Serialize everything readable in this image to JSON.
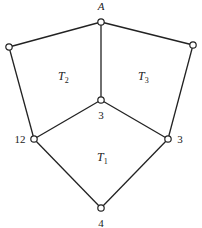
{
  "diagram": {
    "nodes": [
      {
        "id": "A",
        "x": 101,
        "y": 22,
        "label": "A",
        "label_x": 101,
        "label_y": 10,
        "italic": true
      },
      {
        "id": "LT",
        "x": 9,
        "y": 47,
        "label": "",
        "label_x": 0,
        "label_y": 0
      },
      {
        "id": "RT",
        "x": 193,
        "y": 45,
        "label": "",
        "label_x": 0,
        "label_y": 0
      },
      {
        "id": "C",
        "x": 101,
        "y": 100,
        "label": "3",
        "label_x": 101,
        "label_y": 119
      },
      {
        "id": "LB",
        "x": 34,
        "y": 139,
        "label": "12",
        "label_x": 20,
        "label_y": 143
      },
      {
        "id": "RB",
        "x": 168,
        "y": 139,
        "label": "3",
        "label_x": 180,
        "label_y": 143
      },
      {
        "id": "B",
        "x": 101,
        "y": 208,
        "label": "4",
        "label_x": 101,
        "label_y": 227
      }
    ],
    "edges": [
      [
        "A",
        "LT"
      ],
      [
        "A",
        "RT"
      ],
      [
        "A",
        "C"
      ],
      [
        "LT",
        "LB"
      ],
      [
        "RT",
        "RB"
      ],
      [
        "C",
        "LB"
      ],
      [
        "C",
        "RB"
      ],
      [
        "LB",
        "B"
      ],
      [
        "RB",
        "B"
      ]
    ],
    "regions": [
      {
        "name": "T",
        "sub": "2",
        "x": 58,
        "y": 80
      },
      {
        "name": "T",
        "sub": "3",
        "x": 138,
        "y": 80
      },
      {
        "name": "T",
        "sub": "1",
        "x": 97,
        "y": 161
      }
    ]
  }
}
